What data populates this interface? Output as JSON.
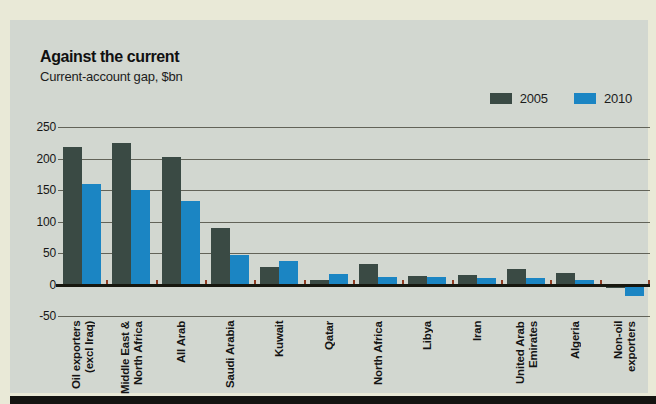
{
  "title": "Against the current",
  "subtitle": "Current-account gap, $bn",
  "colors": {
    "page_background": "#e9e9d7",
    "panel_background": "#d2d7d0",
    "series_2005": "#3a4a44",
    "series_2010": "#1b85c3",
    "gridline": "#46463a",
    "axis": "#17170f",
    "tick": "#8f3c22",
    "bottom_rule": "#141411",
    "text": "#141414"
  },
  "legend": {
    "items": [
      {
        "label": "2005",
        "color": "#3a4a44"
      },
      {
        "label": "2010",
        "color": "#1b85c3"
      }
    ]
  },
  "chart_data": {
    "type": "bar",
    "title": "Against the current",
    "subtitle": "Current-account gap, $bn",
    "categories": [
      "Oil exporters\n(excl Iraq)",
      "Middle East &\nNorth Africa",
      "All Arab",
      "Saudi Arabia",
      "Kuwait",
      "Qatar",
      "North Africa",
      "Libya",
      "Iran",
      "United Arab\nEmirates",
      "Algeria",
      "Non-oil\nexporters"
    ],
    "series": [
      {
        "name": "2005",
        "color": "#3a4a44",
        "values": [
          218,
          224,
          202,
          90,
          28,
          7,
          32,
          13,
          15,
          25,
          18,
          -2
        ]
      },
      {
        "name": "2010",
        "color": "#1b85c3",
        "values": [
          160,
          150,
          133,
          47,
          38,
          17,
          12,
          12,
          10,
          10,
          7,
          -15
        ]
      }
    ],
    "ylabel": "",
    "xlabel": "",
    "ylim": [
      -50,
      250
    ],
    "yticks": [
      250,
      200,
      150,
      100,
      50,
      0,
      -50
    ],
    "grid": true,
    "legend_position": "top-right"
  }
}
